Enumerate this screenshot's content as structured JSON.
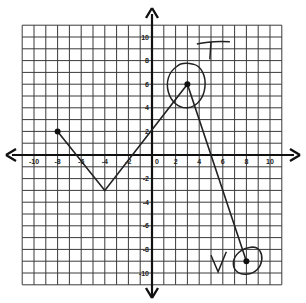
{
  "chart_data": {
    "type": "line",
    "title": "",
    "xlabel": "",
    "ylabel": "",
    "xlim": [
      -11,
      11
    ],
    "ylim": [
      -11,
      11
    ],
    "grid": true,
    "x_ticks": [
      -10,
      -8,
      -6,
      -4,
      -2,
      0,
      2,
      4,
      6,
      8,
      10
    ],
    "y_ticks": [
      -10,
      -8,
      -6,
      -4,
      -2,
      2,
      4,
      6,
      8,
      10
    ],
    "series": [
      {
        "name": "piecewise",
        "points": [
          [
            -8,
            2
          ],
          [
            -4,
            -3
          ],
          [
            3,
            6
          ],
          [
            8,
            -9
          ]
        ]
      }
    ],
    "endpoints": [
      [
        -8,
        2
      ],
      [
        3,
        6
      ],
      [
        8,
        -9
      ]
    ],
    "annotations": [
      {
        "text": "T",
        "near": [
          3,
          6
        ],
        "note": "handwritten, circled point"
      },
      {
        "text": "V",
        "near": [
          8,
          -9
        ],
        "note": "handwritten, circled point"
      }
    ]
  },
  "colors": {
    "grid": "#3a3a3a",
    "axis": "#111111",
    "line": "#222222"
  }
}
